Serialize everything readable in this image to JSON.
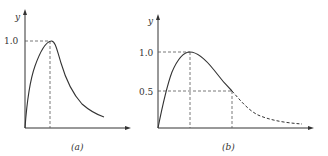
{
  "panels": [
    {
      "id": "a",
      "caption": "(a)",
      "y_axis_label": "y",
      "y_ticks": [
        "1.0"
      ],
      "description": "Sharp rise to peak of 1.0, then decaying tail (solid)"
    },
    {
      "id": "b",
      "caption": "(b)",
      "y_axis_label": "y",
      "y_ticks": [
        "1.0",
        "0.5"
      ],
      "description": "Rise to peak 1.0, decline to 0.5 (solid), then dashed tail"
    }
  ]
}
